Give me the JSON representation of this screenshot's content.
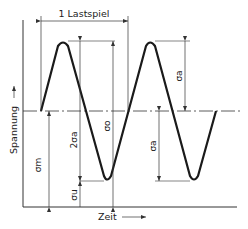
{
  "diagram": {
    "cycle_label": "1 Lastspiel",
    "y_axis_label": "Spannung",
    "x_axis_label": "Zeit",
    "symbols": {
      "sigma_m": "σm",
      "sigma_a": "σa",
      "two_sigma_a": "2σa",
      "sigma_o": "σo",
      "sigma_u": "σu"
    },
    "colors": {
      "line": "#1a1a1a",
      "thin": "#333333",
      "background": "#ffffff"
    }
  }
}
